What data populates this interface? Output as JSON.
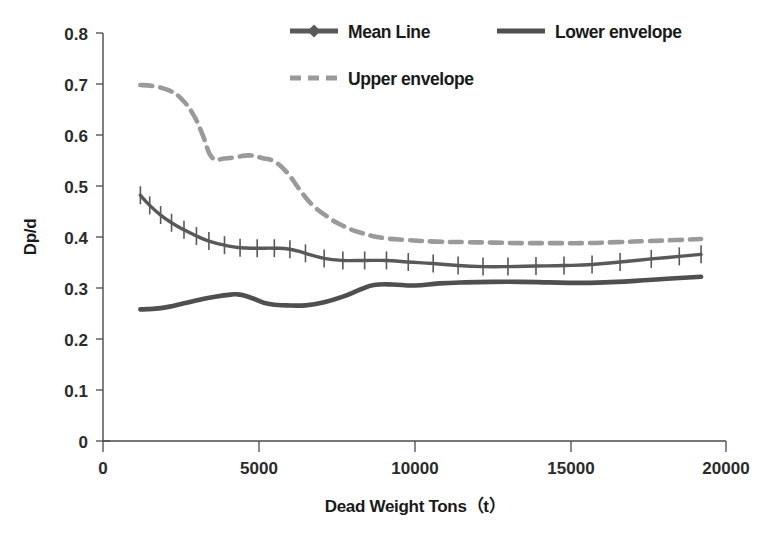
{
  "chart_data": {
    "type": "line",
    "title": "",
    "xlabel": "Dead Weight Tons（t）",
    "ylabel": "Dp/d",
    "xlim": [
      0,
      20000
    ],
    "ylim": [
      0,
      0.8
    ],
    "grid": false,
    "legend_position": "top",
    "x_ticks": [
      "0",
      "5000",
      "10000",
      "15000",
      "20000"
    ],
    "x_tick_values": [
      0,
      5000,
      10000,
      15000,
      20000
    ],
    "y_ticks": [
      "0",
      "0.1",
      "0.2",
      "0.3",
      "0.4",
      "0.5",
      "0.6",
      "0.7",
      "0.8"
    ],
    "y_tick_values": [
      0,
      0.1,
      0.2,
      0.3,
      0.4,
      0.5,
      0.6,
      0.7,
      0.8
    ],
    "series": [
      {
        "name": "Mean Line",
        "style": "solid-with-markers",
        "marker": "diamond",
        "color": "#595959",
        "x": [
          1200,
          1500,
          1850,
          2200,
          2600,
          3000,
          3400,
          3900,
          4400,
          4950,
          5500,
          6000,
          6500,
          7100,
          7700,
          8400,
          9100,
          9800,
          10600,
          11400,
          12200,
          13000,
          13900,
          14800,
          15700,
          16600,
          17600,
          18500,
          19200
        ],
        "values": [
          0.482,
          0.462,
          0.443,
          0.428,
          0.414,
          0.402,
          0.392,
          0.384,
          0.379,
          0.378,
          0.378,
          0.376,
          0.368,
          0.358,
          0.354,
          0.354,
          0.354,
          0.351,
          0.348,
          0.344,
          0.342,
          0.342,
          0.343,
          0.344,
          0.346,
          0.351,
          0.357,
          0.362,
          0.366
        ]
      },
      {
        "name": "Lower envelope",
        "style": "solid",
        "color": "#4f4f4f",
        "x": [
          1200,
          1600,
          2100,
          2600,
          3100,
          3600,
          4100,
          4400,
          4800,
          5300,
          5900,
          6500,
          7100,
          7700,
          8300,
          8700,
          9300,
          10000,
          10800,
          11600,
          12500,
          13400,
          14300,
          15200,
          16100,
          17100,
          18100,
          19200
        ],
        "values": [
          0.258,
          0.259,
          0.263,
          0.27,
          0.277,
          0.283,
          0.287,
          0.287,
          0.28,
          0.269,
          0.266,
          0.266,
          0.272,
          0.283,
          0.298,
          0.306,
          0.307,
          0.305,
          0.309,
          0.311,
          0.312,
          0.312,
          0.311,
          0.31,
          0.311,
          0.314,
          0.318,
          0.322
        ]
      },
      {
        "name": "Upper envelope",
        "style": "dashed",
        "color": "#9a9a9a",
        "x": [
          1200,
          1600,
          2100,
          2500,
          2900,
          3200,
          3500,
          3900,
          4300,
          4700,
          5100,
          5500,
          5900,
          6300,
          6700,
          7200,
          7700,
          8300,
          9000,
          9800,
          10700,
          11600,
          12500,
          13500,
          14500,
          15500,
          16500,
          17500,
          18400,
          19200
        ],
        "values": [
          0.698,
          0.696,
          0.688,
          0.672,
          0.64,
          0.6,
          0.556,
          0.554,
          0.557,
          0.56,
          0.555,
          0.548,
          0.527,
          0.494,
          0.464,
          0.44,
          0.422,
          0.408,
          0.398,
          0.394,
          0.391,
          0.39,
          0.389,
          0.388,
          0.388,
          0.388,
          0.39,
          0.392,
          0.394,
          0.396
        ]
      }
    ]
  },
  "legend": {
    "items": [
      {
        "label": "Mean Line"
      },
      {
        "label": "Lower envelope"
      },
      {
        "label": "Upper envelope"
      }
    ]
  },
  "axes": {
    "x_title": "Dead Weight Tons（t）",
    "y_title": "Dp/d"
  },
  "colors": {
    "mean": "#595959",
    "lower": "#4f4f4f",
    "upper": "#9a9a9a",
    "axis": "#4a4a4a",
    "text": "#1a1a1a",
    "background": "#ffffff"
  }
}
